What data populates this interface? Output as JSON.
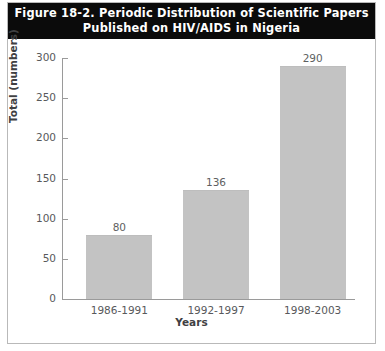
{
  "figure": {
    "title_line1": "Figure 18-2. Periodic Distribution of Scientific Papers",
    "title_line2": "Published on HIV/AIDS in Nigeria",
    "banner_color": "#0b0b0b",
    "banner_text_color": "#ffffff",
    "border_color": "#b9b9b9",
    "background": "#ffffff"
  },
  "chart_data": {
    "type": "bar",
    "title": "Figure 18-2. Periodic Distribution of Scientific Papers Published on HIV/AIDS in Nigeria",
    "categories": [
      "1986-1991",
      "1992-1997",
      "1998-2003"
    ],
    "values": [
      80,
      136,
      290
    ],
    "data_labels": [
      "80",
      "136",
      "290"
    ],
    "xlabel": "Years",
    "ylabel": "Total (numbers)",
    "ylim": [
      0,
      300
    ],
    "yticks": [
      0,
      50,
      100,
      150,
      200,
      250,
      300
    ],
    "ytick_labels": [
      "0",
      "50",
      "100",
      "150",
      "200",
      "250",
      "300"
    ],
    "grid": false,
    "legend": null,
    "bar_color": "#c3c3c3",
    "axis_color": "#9a9a9a",
    "tick_label_color": "#58595b"
  }
}
